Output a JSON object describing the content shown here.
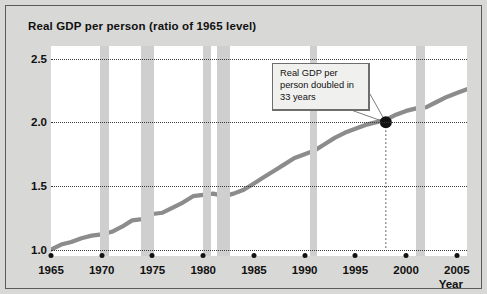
{
  "chart_data": {
    "type": "line",
    "title": "Real GDP per person (ratio of 1965 level)",
    "xlabel": "Year",
    "ylabel": "",
    "xlim": [
      1965,
      2006
    ],
    "ylim": [
      0.95,
      2.6
    ],
    "grid": true,
    "legend": "none",
    "yticks": [
      "1.0",
      "1.5",
      "2.0",
      "2.5"
    ],
    "ytick_values": [
      1.0,
      1.5,
      2.0,
      2.5
    ],
    "xticks": [
      "1965",
      "1970",
      "1975",
      "1980",
      "1985",
      "1990",
      "1995",
      "2000",
      "2005"
    ],
    "xtick_values": [
      1965,
      1970,
      1975,
      1980,
      1985,
      1990,
      1995,
      2000,
      2005
    ],
    "series": [
      {
        "name": "Real GDP per person (ratio of 1965 level)",
        "color": "#8c8c8c",
        "x": [
          1965,
          1966,
          1967,
          1968,
          1969,
          1970,
          1971,
          1972,
          1973,
          1974,
          1975,
          1976,
          1977,
          1978,
          1979,
          1980,
          1981,
          1982,
          1983,
          1984,
          1985,
          1986,
          1987,
          1988,
          1989,
          1990,
          1991,
          1992,
          1993,
          1994,
          1995,
          1996,
          1997,
          1998,
          1999,
          2000,
          2001,
          2002,
          2003,
          2004,
          2005,
          2006
        ],
        "values": [
          1.0,
          1.04,
          1.06,
          1.09,
          1.11,
          1.12,
          1.14,
          1.18,
          1.23,
          1.24,
          1.28,
          1.29,
          1.33,
          1.37,
          1.42,
          1.43,
          1.44,
          1.42,
          1.44,
          1.47,
          1.52,
          1.57,
          1.62,
          1.67,
          1.72,
          1.75,
          1.78,
          1.83,
          1.88,
          1.92,
          1.95,
          1.98,
          2.0,
          2.02,
          2.06,
          2.09,
          2.11,
          2.12,
          2.16,
          2.2,
          2.23,
          2.26
        ]
      }
    ],
    "recession_bands": [
      {
        "start": 1969.8,
        "end": 1970.7
      },
      {
        "start": 1973.9,
        "end": 1975.2
      },
      {
        "start": 1980.0,
        "end": 1980.8
      },
      {
        "start": 1981.4,
        "end": 1982.6
      },
      {
        "start": 1990.5,
        "end": 1991.2
      },
      {
        "start": 2001.0,
        "end": 2001.9
      }
    ],
    "annotations": [
      {
        "text": "Real GDP per person doubled in 33 years",
        "marker_x": 1998,
        "marker_y": 2.0,
        "marker_label": "doubling-point"
      }
    ]
  },
  "colors": {
    "background": "#d8d8d6",
    "plot_background": "#ffffff",
    "line": "#8c8c8c",
    "recession_band": "#cfcfcf",
    "grid": "#3a3a3a",
    "text": "#101010",
    "annotation_fill": "#f0f0ee",
    "annotation_border": "#6d6d6d",
    "marker": "#111111"
  }
}
